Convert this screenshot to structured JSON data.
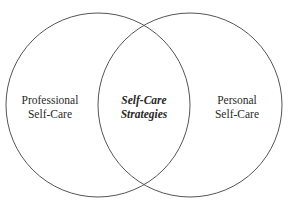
{
  "diagram": {
    "type": "venn",
    "stroke_color": "#555555",
    "background": "#ffffff",
    "circles": [
      {
        "name": "professional",
        "cx": 98,
        "cy": 105,
        "r": 92
      },
      {
        "name": "personal",
        "cx": 190,
        "cy": 105,
        "r": 92
      }
    ],
    "labels": {
      "left": {
        "line1": "Professional",
        "line2": "Self-Care"
      },
      "center": {
        "line1": "Self-Care",
        "line2": "Strategies"
      },
      "right": {
        "line1": "Personal",
        "line2": "Self-Care"
      }
    }
  }
}
